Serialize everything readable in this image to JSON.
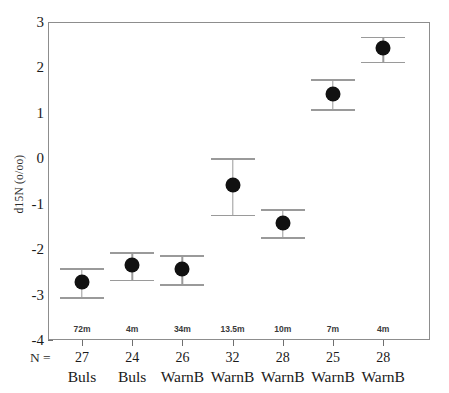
{
  "chart_data": {
    "type": "scatter",
    "title": "",
    "xlabel": "",
    "ylabel": "d15N (o/oo)",
    "ylim": [
      -4,
      3
    ],
    "yticks": [
      3,
      2,
      1,
      0,
      -1,
      -2,
      -3,
      -4
    ],
    "ytick_labels": [
      "3",
      "2",
      "1",
      "0",
      "-1",
      "-2",
      "-3",
      "-4"
    ],
    "grid": false,
    "legend": null,
    "error_bar_type": "95% CI",
    "n_prefix": "N =",
    "categories": [
      "Buls",
      "Buls",
      "WarnB",
      "WarnB",
      "WarnB",
      "WarnB",
      "WarnB"
    ],
    "depths": [
      "72m",
      "4m",
      "34m",
      "13.5m",
      "10m",
      "7m",
      "4m"
    ],
    "n_values": [
      "27",
      "24",
      "26",
      "32",
      "28",
      "25",
      "28"
    ],
    "points": [
      {
        "index": 0,
        "group": "Buls",
        "depth": "72m",
        "n": "27",
        "mean": -2.72,
        "ci_low": -3.05,
        "ci_high": -2.42
      },
      {
        "index": 1,
        "group": "Buls",
        "depth": "4m",
        "n": "24",
        "mean": -2.35,
        "ci_low": -2.67,
        "ci_high": -2.06
      },
      {
        "index": 2,
        "group": "WarnB",
        "depth": "34m",
        "n": "26",
        "mean": -2.43,
        "ci_low": -2.77,
        "ci_high": -2.13
      },
      {
        "index": 3,
        "group": "WarnB",
        "depth": "13.5m",
        "n": "32",
        "mean": -0.58,
        "ci_low": -1.24,
        "ci_high": 0.0
      },
      {
        "index": 4,
        "group": "WarnB",
        "depth": "10m",
        "n": "28",
        "mean": -1.43,
        "ci_low": -1.74,
        "ci_high": -1.12
      },
      {
        "index": 5,
        "group": "WarnB",
        "depth": "7m",
        "n": "25",
        "mean": 1.42,
        "ci_low": 1.08,
        "ci_high": 1.75
      },
      {
        "index": 6,
        "group": "WarnB",
        "depth": "4m",
        "n": "28",
        "mean": 2.43,
        "ci_low": 2.13,
        "ci_high": 2.68
      }
    ],
    "colors": {
      "marker": "#111111",
      "errorbar": "#9a9a9a",
      "axis": "#8d8d8d",
      "text": "#1a1a1a",
      "background": "#ffffff"
    }
  }
}
